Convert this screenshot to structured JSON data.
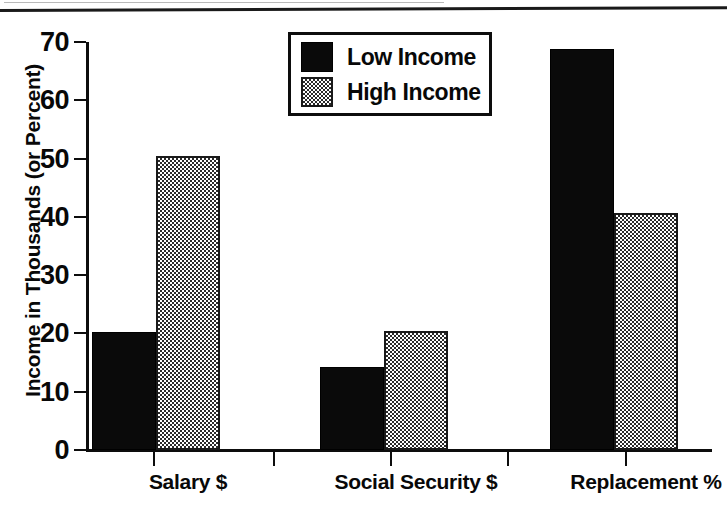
{
  "chart_data": {
    "type": "bar",
    "title": "",
    "xlabel": "",
    "ylabel": "Income in Thousands (or Percent)",
    "categories": [
      "Salary $",
      "Social Security $",
      "Replacement %"
    ],
    "series": [
      {
        "name": "Low Income",
        "values": [
          20.2,
          14.2,
          68.8
        ],
        "swatch": "solid-black"
      },
      {
        "name": "High Income",
        "values": [
          50.4,
          20.4,
          40.6
        ],
        "swatch": "checkered-gray"
      }
    ],
    "ylim": [
      0,
      70
    ],
    "yticks": [
      0,
      10,
      20,
      30,
      40,
      50,
      60,
      70
    ],
    "ytick_labels": [
      "0",
      "10",
      "20",
      "30",
      "40",
      "50",
      "60",
      "70"
    ],
    "grid": false,
    "legend_position": "top-center",
    "colors": {
      "low_income": "#0a0a0a",
      "high_income": "#c8c8c8",
      "axis": "#0d0d0d",
      "background": "#ffffff"
    }
  },
  "legend": {
    "entries": [
      {
        "label": "Low Income"
      },
      {
        "label": "High Income"
      }
    ]
  }
}
